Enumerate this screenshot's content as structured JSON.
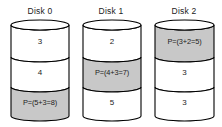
{
  "diagram": {
    "type": "raid-parity-disks",
    "background_color": "#ffffff",
    "outline_color": "#000000",
    "data_block_color": "#ffffff",
    "parity_block_color": "#c8c8c8",
    "disks": [
      {
        "title": "Disk 0",
        "blocks": [
          {
            "label": "3",
            "kind": "data"
          },
          {
            "label": "4",
            "kind": "data"
          },
          {
            "label": "P=(5+3=8)",
            "kind": "parity"
          }
        ]
      },
      {
        "title": "Disk 1",
        "blocks": [
          {
            "label": "2",
            "kind": "data"
          },
          {
            "label": "P=(4+3=7)",
            "kind": "parity"
          },
          {
            "label": "5",
            "kind": "data"
          }
        ]
      },
      {
        "title": "Disk 2",
        "blocks": [
          {
            "label": "P=(3+2=5)",
            "kind": "parity"
          },
          {
            "label": "3",
            "kind": "data"
          },
          {
            "label": "3",
            "kind": "data"
          }
        ]
      }
    ]
  }
}
